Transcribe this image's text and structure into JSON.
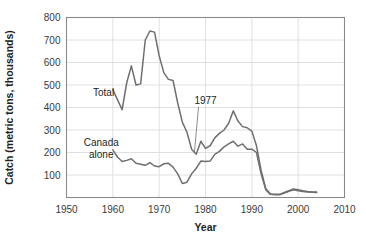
{
  "chart_data": {
    "type": "line",
    "title": "",
    "xlabel": "Year",
    "ylabel": "Catch (metric tons, thousands)",
    "xlim": [
      1950,
      2010
    ],
    "ylim": [
      0,
      800
    ],
    "xticks": [
      1950,
      1960,
      1970,
      1980,
      1990,
      2000,
      2010
    ],
    "yticks": [
      100,
      200,
      300,
      400,
      500,
      600,
      700,
      800
    ],
    "xtick_labels": [
      "1950",
      "1960",
      "1970",
      "1980",
      "1990",
      "2000",
      "2010"
    ],
    "ytick_labels": [
      "100",
      "200",
      "300",
      "400",
      "500",
      "600",
      "700",
      "800"
    ],
    "grid": true,
    "legend": "inline-labels",
    "line_color": "#6f6f6f",
    "grid_color": "#dcdcdc",
    "frame_color": "#8a8a8a",
    "series": [
      {
        "name": "Total",
        "label": "Total",
        "label_x": 1958.0,
        "label_y": 452,
        "x": [
          1960,
          1961,
          1962,
          1963,
          1964,
          1965,
          1966,
          1967,
          1968,
          1969,
          1970,
          1971,
          1972,
          1973,
          1974,
          1975,
          1976,
          1977,
          1978,
          1979,
          1980,
          1981,
          1982,
          1983,
          1984,
          1985,
          1986,
          1987,
          1988,
          1989,
          1990,
          1991,
          1992,
          1993,
          1994,
          1995,
          1996,
          1997,
          1998,
          1999,
          2000,
          2001,
          2002,
          2003,
          2004
        ],
        "values": [
          480,
          435,
          390,
          510,
          585,
          500,
          505,
          700,
          740,
          735,
          630,
          555,
          525,
          520,
          420,
          335,
          290,
          215,
          192,
          250,
          218,
          230,
          265,
          285,
          300,
          330,
          385,
          340,
          315,
          310,
          295,
          230,
          120,
          40,
          16,
          14,
          14,
          22,
          30,
          38,
          34,
          30,
          27,
          25,
          24
        ]
      },
      {
        "name": "Canada alone",
        "label": "Canada\nalone",
        "label_line1": "Canada",
        "label_line2": "alone",
        "label_x": 1957.5,
        "label_y": 228,
        "x": [
          1960,
          1961,
          1962,
          1963,
          1964,
          1965,
          1966,
          1967,
          1968,
          1969,
          1970,
          1971,
          1972,
          1973,
          1974,
          1975,
          1976,
          1977,
          1978,
          1979,
          1980,
          1981,
          1982,
          1983,
          1984,
          1985,
          1986,
          1987,
          1988,
          1989,
          1990,
          1991,
          1992,
          1993,
          1994,
          1995,
          1996,
          1997,
          1998,
          1999,
          2000,
          2001,
          2002,
          2003,
          2004
        ],
        "values": [
          212,
          180,
          160,
          165,
          172,
          152,
          148,
          143,
          155,
          140,
          137,
          150,
          152,
          135,
          105,
          62,
          68,
          105,
          130,
          162,
          160,
          162,
          192,
          205,
          225,
          238,
          250,
          228,
          238,
          215,
          215,
          200,
          105,
          35,
          14,
          12,
          12,
          20,
          28,
          34,
          30,
          27,
          25,
          23,
          22
        ]
      }
    ],
    "annotations": [
      {
        "text": "1977",
        "label_x": 1980.0,
        "label_y": 415,
        "point_x": 1977.6,
        "point_y": 198
      }
    ]
  }
}
